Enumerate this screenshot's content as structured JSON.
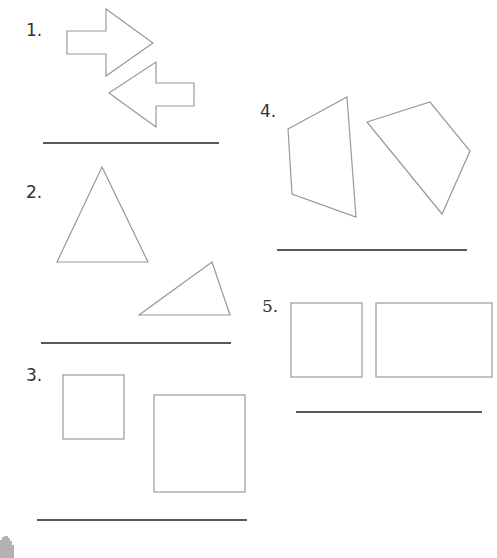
{
  "problems": [
    {
      "label": "1.",
      "shapes": "two arrows"
    },
    {
      "label": "2.",
      "shapes": "two triangles"
    },
    {
      "label": "3.",
      "shapes": "two squares"
    },
    {
      "label": "4.",
      "shapes": "two quadrilaterals"
    },
    {
      "label": "5.",
      "shapes": "square and rectangle"
    }
  ],
  "colors": {
    "shape_stroke": "#999999",
    "answer_line": "#222222",
    "text": "#333333"
  }
}
